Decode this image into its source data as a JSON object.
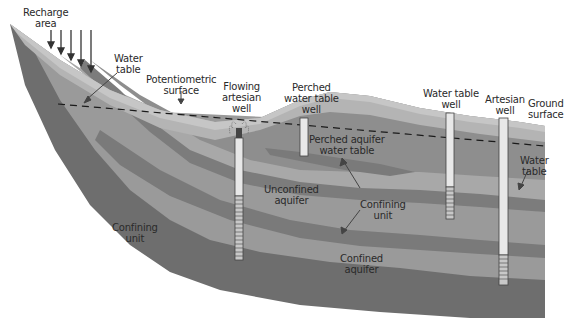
{
  "diagram": {
    "colors": {
      "background": "#ffffff",
      "confining_unit_outer": "#6e6e6e",
      "confined_aquifer": "#9a9a9a",
      "deep_confining": "#7a7a7a",
      "unconfined_aquifer": "#a8a8a8",
      "saturated_zone": "#8e8e8e",
      "unsaturated_zone": "#b4b4b4",
      "surface_layer": "#c4c4c4",
      "well_casing": "#e8e8e8",
      "dashed_line": "#1a1a1a"
    },
    "labels": {
      "recharge_area": [
        "Recharge",
        "area"
      ],
      "water_table_left": [
        "Water",
        "table"
      ],
      "potentiometric_surface": [
        "Potentiometric",
        "surface"
      ],
      "flowing_artesian_well": [
        "Flowing",
        "artesian",
        "well"
      ],
      "perched_water_table_well": [
        "Perched",
        "water table",
        "well"
      ],
      "water_table_well": [
        "Water table",
        "well"
      ],
      "artesian_well": [
        "Artesian",
        "well"
      ],
      "ground_surface": [
        "Ground",
        "surface"
      ],
      "perched_aquifer_water_table": [
        "Perched aquifer",
        "water table"
      ],
      "water_table_right": [
        "Water",
        "table"
      ],
      "unconfined_aquifer": [
        "Unconfined",
        "aquifer"
      ],
      "confining_unit_middle": [
        "Confining",
        "unit"
      ],
      "confining_unit_left": [
        "Confining",
        "unit"
      ],
      "confined_aquifer": [
        "Confined",
        "aquifer"
      ]
    },
    "recharge_arrows": 5
  }
}
